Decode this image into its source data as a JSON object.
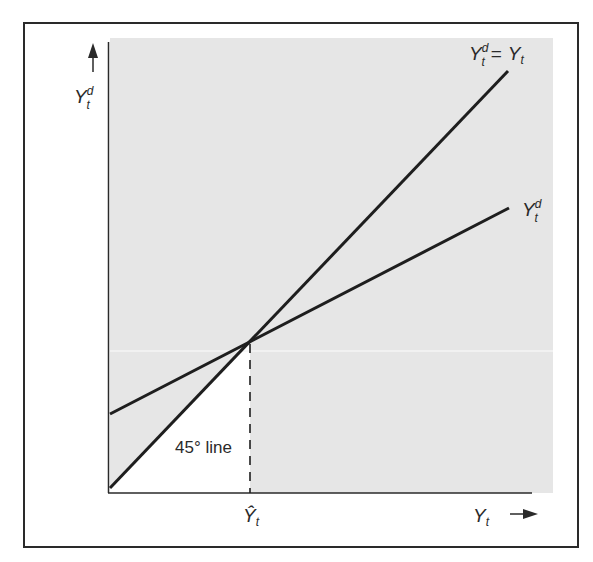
{
  "diagram": {
    "type": "keynesian-cross",
    "y_axis_label": {
      "base": "Y",
      "sub": "t",
      "sup": "d"
    },
    "x_axis_label": {
      "base": "Y",
      "sub": "t"
    },
    "equilibrium_label": {
      "base": "Ŷ",
      "sub": "t"
    },
    "line_45_label": "45° line",
    "line_45_end_label": {
      "lhs_base": "Y",
      "lhs_sub": "t",
      "lhs_sup": "d",
      "eq": "=",
      "rhs_base": "Y",
      "rhs_sub": "t"
    },
    "demand_line_label": {
      "base": "Y",
      "sub": "t",
      "sup": "d"
    },
    "colors": {
      "shade": "#e6e6e6",
      "line": "#1e1e1e",
      "frame": "#2a2a2a",
      "text": "#2a2a2a"
    }
  }
}
